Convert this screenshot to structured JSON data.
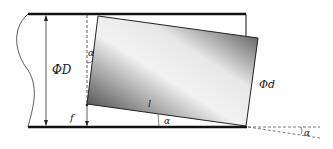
{
  "diagram": {
    "labels": {
      "pipe_diameter": "ΦD",
      "part_diameter": "Φd",
      "length": "l",
      "angle_left": "α",
      "angle_bottom": "α",
      "angle_right": "α",
      "offset": "f"
    },
    "colors": {
      "line": "#111111",
      "gradient_dark": "#333333",
      "gradient_light": "#f4f4f4"
    }
  }
}
